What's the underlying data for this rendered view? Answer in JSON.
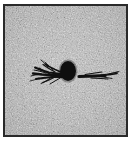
{
  "image": {
    "kind": "micrograph",
    "caption": "",
    "frame": {
      "border_color": "#2a2a2a",
      "border_width_px": 2,
      "left_px": 3,
      "top_px": 4,
      "width_px": 125,
      "height_px": 133
    },
    "background": {
      "base_color": "#bcbcbc",
      "grain_dark_color": "#6e6e6e",
      "grain_light_color": "#e2e2e2",
      "texture": "speckled-granular"
    },
    "features": [
      {
        "id": "inclusion",
        "label": "central dark inclusion",
        "shape": "ellipse",
        "color": "#101010",
        "center_x_px": 68,
        "center_y_px": 71,
        "radius_x_px": 8,
        "radius_y_px": 10
      },
      {
        "id": "crack-left",
        "label": "branching crack, left",
        "shape": "dendritic",
        "color": "#111111",
        "start_x_px": 60,
        "end_x_px": 29,
        "y_px": 71,
        "branching": "true"
      },
      {
        "id": "crack-right",
        "label": "linear crack, right",
        "shape": "linear-tapering",
        "color": "#111111",
        "start_x_px": 76,
        "end_x_px": 113,
        "y_px": 71,
        "branching": "false"
      }
    ]
  }
}
